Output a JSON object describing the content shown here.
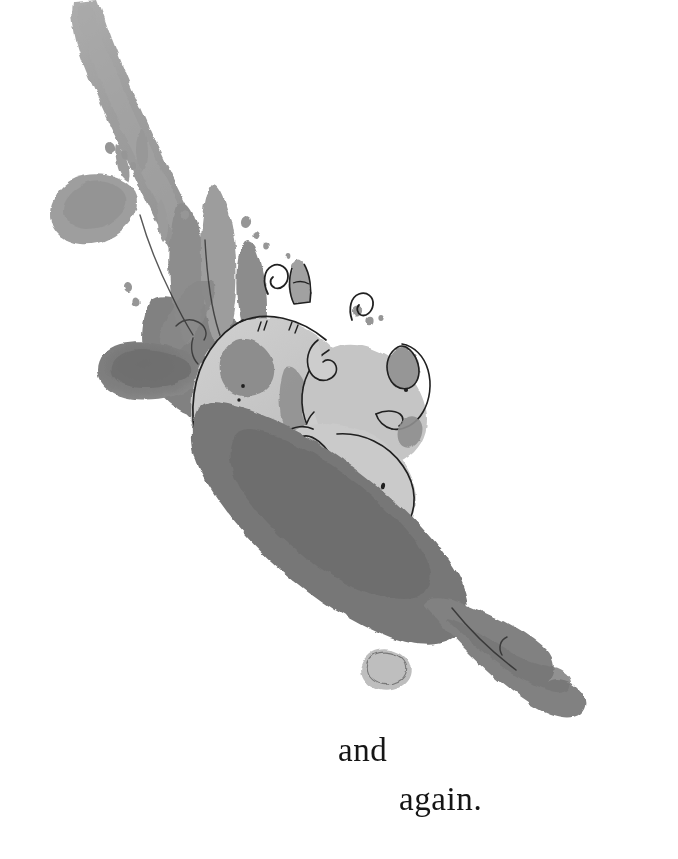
{
  "page": {
    "kind": "picture-book-illustration-page",
    "background_color": "#ffffff",
    "width": 678,
    "height": 859
  },
  "caption": {
    "lines": [
      {
        "text": "and"
      },
      {
        "text": "again."
      }
    ],
    "full_text": "and again.",
    "color": "#151515",
    "alignment": "bottom-right-staggered"
  },
  "illustration": {
    "title": "Pigs sliding down a muddy slope",
    "medium": "ink-and-watercolor-wash",
    "palette": {
      "paper": "#ffffff",
      "mud_light": "#b2b2b2",
      "mud_mid": "#9a9a9a",
      "mud_dark": "#7d7d7d",
      "mud_darkest": "#686868",
      "pig_body": "#c0c0c0",
      "pig_light": "#d2d2d2",
      "pig_spot": "#8a8a8a",
      "ink_line": "#1c1c1c"
    },
    "elements": [
      {
        "name": "mud-splash-trail",
        "description": "long diagonal watercolor streak from top-left descending to center"
      },
      {
        "name": "splash-droplets",
        "description": "scattered small gray flecks along the trail"
      },
      {
        "name": "mud-splash-fingers",
        "description": "upward finger-like splash shapes behind the pigs"
      },
      {
        "name": "big-pig",
        "description": "large spotted pig sliding head-down"
      },
      {
        "name": "middle-pig",
        "description": "second pig riding behind the first"
      },
      {
        "name": "small-piglet",
        "description": "tiny piglet tumbling at the front"
      },
      {
        "name": "curly-tails",
        "description": "curled ink pig tails at the top of the pile"
      },
      {
        "name": "mud-shadow",
        "description": "dark wash beneath the pigs"
      },
      {
        "name": "mud-tail-hook",
        "description": "curved mud streak ending with a hooked tip at lower right"
      }
    ]
  }
}
